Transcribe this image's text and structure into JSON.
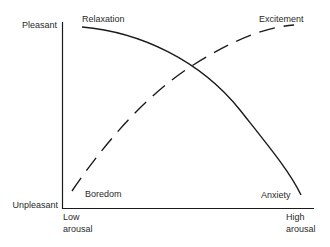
{
  "diagram": {
    "type": "curve-diagram",
    "y_axis": {
      "top_label": "Pleasant",
      "bottom_label": "Unpleasant"
    },
    "x_axis": {
      "left_label_line1": "Low",
      "left_label_line2": "arousal",
      "right_label_line1": "High",
      "right_label_line2": "arousal"
    },
    "curves": [
      {
        "name": "solid",
        "style": "solid",
        "start_label": "Relaxation",
        "end_label": "Anxiety"
      },
      {
        "name": "dashed",
        "style": "dashed",
        "start_label": "Boredom",
        "end_label": "Excitement"
      }
    ],
    "colors": {
      "line": "#1a1a1a",
      "text": "#2a2a2a",
      "background": "#ffffff"
    }
  }
}
